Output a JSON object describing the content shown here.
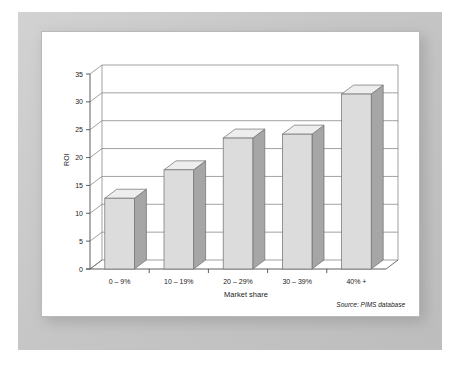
{
  "figure": {
    "source_note": "Source: PIMS database"
  },
  "chart_data": {
    "type": "bar",
    "title": "",
    "subtitle": "",
    "xlabel": "Market share",
    "ylabel": "ROI",
    "categories": [
      "0 – 9%",
      "10 – 19%",
      "20 – 29%",
      "30 – 39%",
      "40% +"
    ],
    "values": [
      12.7,
      17.8,
      23.5,
      24.2,
      31.4
    ],
    "ylim": [
      0,
      35
    ],
    "yticks": [
      0,
      5,
      10,
      15,
      20,
      25,
      30,
      35
    ],
    "ytick_labels": [
      "0",
      "5",
      "10",
      "15",
      "20",
      "25",
      "30",
      "35"
    ],
    "grid": "horizontal",
    "legend": "none",
    "style": "3d-bar",
    "colors": {
      "bar_front": "#dcdcdc",
      "bar_side": "#a6a6a6",
      "bar_top": "#ededed",
      "bar_outline": "#6e6e6e",
      "axis": "#4d4d4d",
      "gridline": "#7a7a7a",
      "panel_background": "#ffffff",
      "frame": "#c6c6c6",
      "text": "#1a1a1a"
    }
  }
}
